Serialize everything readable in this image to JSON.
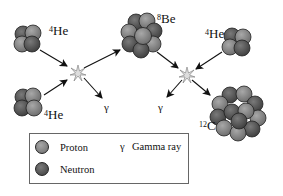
{
  "diagram": {
    "colors": {
      "proton": "#8a8a8a",
      "neutron": "#555555",
      "outline": "#222222",
      "arrow": "#111111",
      "legend_border": "#666666"
    },
    "nuclei": [
      {
        "id": "he4-top",
        "mass": "4",
        "symbol": "He"
      },
      {
        "id": "he4-bottom",
        "mass": "4",
        "symbol": "He"
      },
      {
        "id": "be8",
        "mass": "8",
        "symbol": "Be"
      },
      {
        "id": "he4-right",
        "mass": "4",
        "symbol": "He"
      },
      {
        "id": "c12",
        "mass": "12",
        "symbol": "C"
      }
    ],
    "gamma_symbols": [
      "γ",
      "γ"
    ],
    "legend": {
      "proton_label": "Proton",
      "neutron_label": "Neutron",
      "gamma_symbol": "γ",
      "gamma_label": "Gamma ray"
    }
  }
}
